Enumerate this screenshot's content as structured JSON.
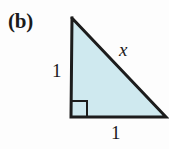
{
  "figure": {
    "part_label": "(b)",
    "background_color": "#fdfdfd",
    "shape": {
      "name": "right-triangle",
      "fill_color": "#cfe9ef",
      "stroke_color": "#1c1c1c",
      "stroke_width": 3,
      "vertices": {
        "apex": [
          72,
          18
        ],
        "bottom_left": [
          71,
          117
        ],
        "bottom_right": [
          166,
          117
        ]
      },
      "right_angle_marker": {
        "corner": "bottom-left",
        "size": 16,
        "stroke_color": "#1c1c1c",
        "stroke_width": 2
      }
    },
    "labels": {
      "vertical_leg": "1",
      "horizontal_leg": "1",
      "hypotenuse": "x"
    }
  }
}
